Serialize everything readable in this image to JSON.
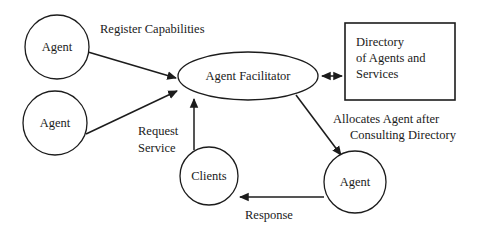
{
  "diagram": {
    "type": "flow-diagram",
    "canvas": {
      "width": 480,
      "height": 234
    },
    "colors": {
      "stroke": "#1c1c1c",
      "fill": "#ffffff",
      "text": "#1a1a1a"
    },
    "nodes": [
      {
        "id": "agent-top-left",
        "label": "Agent",
        "shape": "circle",
        "cx": 57,
        "cy": 47,
        "r": 32
      },
      {
        "id": "agent-mid-left",
        "label": "Agent",
        "shape": "circle",
        "cx": 55,
        "cy": 123,
        "r": 32
      },
      {
        "id": "agent-facilitator",
        "label": "Agent Facilitator",
        "shape": "ellipse",
        "cx": 248,
        "cy": 76,
        "rx": 70,
        "ry": 24
      },
      {
        "id": "directory",
        "label_lines": [
          "Directory",
          "of Agents and",
          "Services"
        ],
        "shape": "rect",
        "x": 345,
        "y": 23,
        "w": 110,
        "h": 77
      },
      {
        "id": "clients",
        "label": "Clients",
        "shape": "circle",
        "cx": 209,
        "cy": 176,
        "r": 29
      },
      {
        "id": "agent-bottom-right",
        "label": "Agent",
        "shape": "circle",
        "cx": 355,
        "cy": 182,
        "r": 31
      }
    ],
    "edges": [
      {
        "id": "register-capabilities",
        "label": "Register Capabilities",
        "from": "agent-top-left",
        "to": "agent-facilitator",
        "arrowheads": "end"
      },
      {
        "id": "register-capabilities-2",
        "label": "",
        "from": "agent-mid-left",
        "to": "agent-facilitator",
        "arrowheads": "end"
      },
      {
        "id": "request-service",
        "label_lines": [
          "Request",
          "Service"
        ],
        "from": "clients",
        "to": "agent-facilitator",
        "arrowheads": "end"
      },
      {
        "id": "facilitator-directory",
        "label": "",
        "from": "agent-facilitator",
        "to": "directory",
        "arrowheads": "both"
      },
      {
        "id": "allocates-agent",
        "label_lines": [
          "Allocates Agent after",
          "Consulting Directory"
        ],
        "from": "agent-facilitator",
        "to": "agent-bottom-right",
        "arrowheads": "end"
      },
      {
        "id": "response",
        "label": "Response",
        "from": "agent-bottom-right",
        "to": "clients",
        "arrowheads": "end"
      }
    ],
    "labels": {
      "register_capabilities": "Register Capabilities",
      "request_line1": "Request",
      "request_line2": "Service",
      "allocates_line1": "Allocates Agent after",
      "allocates_line2": "Consulting Directory",
      "response": "Response",
      "directory_line1": "Directory",
      "directory_line2": "of Agents and",
      "directory_line3": "Services",
      "agent": "Agent",
      "agent_facilitator": "Agent Facilitator",
      "clients": "Clients"
    }
  }
}
